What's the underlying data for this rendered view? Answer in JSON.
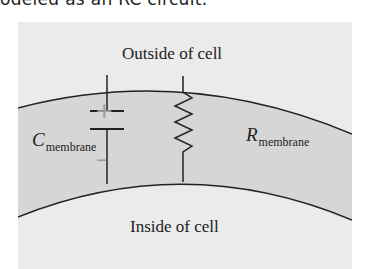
{
  "caption": "odeled as an RC circuit.",
  "diagram": {
    "outside_label": "Outside of cell",
    "inside_label": "Inside of cell",
    "capacitor": {
      "symbol": "C",
      "subscript": "membrane",
      "plus": "+",
      "minus": "–"
    },
    "resistor": {
      "symbol": "R",
      "subscript": "membrane"
    },
    "colors": {
      "background": "#ebebeb",
      "membrane_fill": "#d6d6d6",
      "line": "#222222",
      "sign": "#9a9a9a"
    }
  }
}
